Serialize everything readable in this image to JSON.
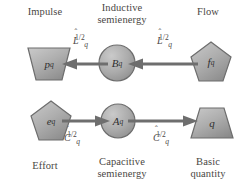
{
  "figure": {
    "background": "#ffffff",
    "shape_fill_light": "#b9b9b9",
    "shape_fill_dark": "#8e8e8e",
    "shape_stroke": "#6b6b6b",
    "arrow_color": "#6e6e6e",
    "text_color": "#4a4744"
  },
  "captions": {
    "impulse": "Impulse",
    "inductive_semienergy": "Inductive\nsemienergy",
    "flow": "Flow",
    "effort": "Effort",
    "capacitive_semienergy": "Capacitive\nsemienergy",
    "basic_quantity": "Basic\nquantity"
  },
  "coefficients": {
    "inductive_left": {
      "base": "L",
      "hat": "ˆ",
      "subscript": "q",
      "superscript": "1/2",
      "plain": "L̂q^1/2"
    },
    "inductive_right": {
      "base": "L",
      "hat": "ˆ",
      "subscript": "q",
      "superscript": "1/2",
      "plain": "L̂q^1/2"
    },
    "capacitive_left": {
      "base": "C",
      "hat": "ˆ",
      "subscript": "q",
      "superscript": "1/2",
      "plain": "Ĉq^1/2"
    },
    "capacitive_right": {
      "base": "C",
      "hat": "ˆ",
      "subscript": "q",
      "superscript": "1/2",
      "plain": "Ĉq^1/2"
    }
  },
  "nodes": {
    "p_q": {
      "base": "p",
      "subscript": "q",
      "shape": "trapezoid-down",
      "row": "top",
      "position": "left"
    },
    "B_q": {
      "base": "B",
      "subscript": "q",
      "shape": "circle",
      "row": "top",
      "position": "center"
    },
    "f_q": {
      "base": "f",
      "subscript": "q",
      "shape": "pentagon",
      "row": "top",
      "position": "right"
    },
    "e_q": {
      "base": "e",
      "subscript": "q",
      "shape": "pentagon",
      "row": "bottom",
      "position": "left"
    },
    "A_q": {
      "base": "A",
      "subscript": "q",
      "shape": "circle",
      "row": "bottom",
      "position": "center"
    },
    "q": {
      "base": "q",
      "subscript": "",
      "shape": "trapezoid-up",
      "row": "bottom",
      "position": "right"
    }
  },
  "arrows": {
    "top_left": {
      "direction": "left",
      "from": "B_q",
      "to": "p_q"
    },
    "top_right": {
      "direction": "left",
      "from": "f_q",
      "to": "B_q"
    },
    "bottom_left": {
      "direction": "right",
      "from": "e_q",
      "to": "A_q"
    },
    "bottom_right": {
      "direction": "right",
      "from": "A_q",
      "to": "q"
    }
  }
}
